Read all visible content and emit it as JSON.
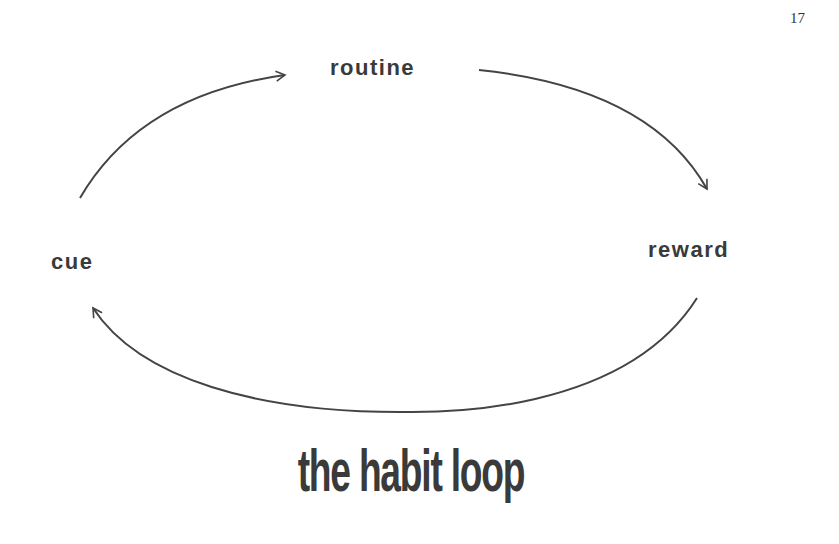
{
  "page": {
    "number": "17"
  },
  "diagram": {
    "type": "cycle",
    "nodes": [
      {
        "id": "routine",
        "label": "routine"
      },
      {
        "id": "reward",
        "label": "reward"
      },
      {
        "id": "cue",
        "label": "cue"
      }
    ],
    "edges": [
      {
        "from": "cue",
        "to": "routine"
      },
      {
        "from": "routine",
        "to": "reward"
      },
      {
        "from": "reward",
        "to": "cue"
      }
    ],
    "stroke_color": "#444444"
  },
  "title": "the habit loop"
}
